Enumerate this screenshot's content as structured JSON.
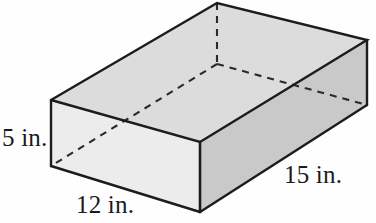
{
  "figure": {
    "name": "rectangular-prism-diagram",
    "shape": "rectangular prism",
    "unit": "in.",
    "dimensions": {
      "height_label": "5 in.",
      "height_value": 5,
      "width_label": "12 in.",
      "width_value": 12,
      "length_label": "15 in.",
      "length_value": 15
    },
    "colors": {
      "top_face": "#dcdcdc",
      "front_face": "#e8e8e8",
      "right_face": "#c9c9c9",
      "outline": "#1c1c1c",
      "hidden_edge": "#2a2a2a",
      "background": "#fefefe",
      "label_text": "#1a1a1a"
    },
    "geometry": {
      "top_left": [
        51,
        100
      ],
      "top_back": [
        217,
        3
      ],
      "top_right": [
        367,
        40
      ],
      "top_front": [
        200,
        142
      ],
      "bottom_left": [
        51,
        166
      ],
      "bottom_front": [
        200,
        212
      ],
      "bottom_right": [
        367,
        105
      ],
      "bottom_back_hidden": [
        217,
        64
      ]
    }
  }
}
